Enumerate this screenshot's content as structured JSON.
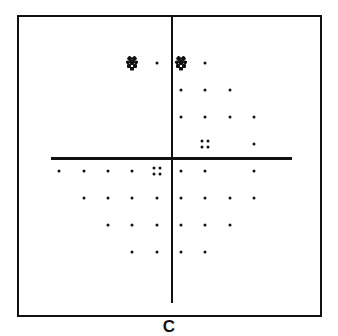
{
  "figure": {
    "caption": "C",
    "colors": {
      "ink": "#111111",
      "background": "#ffffff"
    },
    "grid": {
      "column_x": [
        59,
        84,
        108,
        132,
        157,
        181,
        205,
        230,
        254
      ],
      "row_y": [
        63,
        90,
        117,
        144,
        171,
        198,
        225,
        252
      ]
    },
    "legend_symbols": {
      "square": "solid-black-defect",
      "dense": "dense-stipple-defect",
      "quad": "four-dot-mild",
      "dot": "single-dot-normal"
    },
    "points": [
      {
        "row": 0,
        "col": 3,
        "symbol": "dense"
      },
      {
        "row": 0,
        "col": 4,
        "symbol": "dot"
      },
      {
        "row": 0,
        "col": 5,
        "symbol": "dense"
      },
      {
        "row": 0,
        "col": 6,
        "symbol": "dot"
      },
      {
        "row": 1,
        "col": 2,
        "symbol": "square"
      },
      {
        "row": 1,
        "col": 3,
        "symbol": "square"
      },
      {
        "row": 1,
        "col": 4,
        "symbol": "square"
      },
      {
        "row": 1,
        "col": 5,
        "symbol": "dot"
      },
      {
        "row": 1,
        "col": 6,
        "symbol": "dot"
      },
      {
        "row": 1,
        "col": 7,
        "symbol": "dot"
      },
      {
        "row": 2,
        "col": 1,
        "symbol": "square"
      },
      {
        "row": 2,
        "col": 2,
        "symbol": "square"
      },
      {
        "row": 2,
        "col": 3,
        "symbol": "square"
      },
      {
        "row": 2,
        "col": 4,
        "symbol": "square"
      },
      {
        "row": 2,
        "col": 5,
        "symbol": "dot"
      },
      {
        "row": 2,
        "col": 6,
        "symbol": "dot"
      },
      {
        "row": 2,
        "col": 7,
        "symbol": "dot"
      },
      {
        "row": 2,
        "col": 8,
        "symbol": "dot"
      },
      {
        "row": 3,
        "col": 0,
        "symbol": "square"
      },
      {
        "row": 3,
        "col": 1,
        "symbol": "square"
      },
      {
        "row": 3,
        "col": 2,
        "symbol": "square"
      },
      {
        "row": 3,
        "col": 3,
        "symbol": "square"
      },
      {
        "row": 3,
        "col": 4,
        "symbol": "square"
      },
      {
        "row": 3,
        "col": 5,
        "symbol": "square"
      },
      {
        "row": 3,
        "col": 6,
        "symbol": "quad"
      },
      {
        "row": 3,
        "col": 8,
        "symbol": "dot"
      },
      {
        "row": 4,
        "col": 0,
        "symbol": "dot"
      },
      {
        "row": 4,
        "col": 1,
        "symbol": "dot"
      },
      {
        "row": 4,
        "col": 2,
        "symbol": "dot"
      },
      {
        "row": 4,
        "col": 3,
        "symbol": "dot"
      },
      {
        "row": 4,
        "col": 4,
        "symbol": "quad"
      },
      {
        "row": 4,
        "col": 5,
        "symbol": "dot"
      },
      {
        "row": 4,
        "col": 6,
        "symbol": "dot"
      },
      {
        "row": 4,
        "col": 8,
        "symbol": "dot"
      },
      {
        "row": 5,
        "col": 1,
        "symbol": "dot"
      },
      {
        "row": 5,
        "col": 2,
        "symbol": "dot"
      },
      {
        "row": 5,
        "col": 3,
        "symbol": "dot"
      },
      {
        "row": 5,
        "col": 4,
        "symbol": "dot"
      },
      {
        "row": 5,
        "col": 5,
        "symbol": "dot"
      },
      {
        "row": 5,
        "col": 6,
        "symbol": "dot"
      },
      {
        "row": 5,
        "col": 7,
        "symbol": "dot"
      },
      {
        "row": 5,
        "col": 8,
        "symbol": "dot"
      },
      {
        "row": 6,
        "col": 2,
        "symbol": "dot"
      },
      {
        "row": 6,
        "col": 3,
        "symbol": "dot"
      },
      {
        "row": 6,
        "col": 4,
        "symbol": "dot"
      },
      {
        "row": 6,
        "col": 5,
        "symbol": "dot"
      },
      {
        "row": 6,
        "col": 6,
        "symbol": "dot"
      },
      {
        "row": 6,
        "col": 7,
        "symbol": "dot"
      },
      {
        "row": 7,
        "col": 3,
        "symbol": "dot"
      },
      {
        "row": 7,
        "col": 4,
        "symbol": "dot"
      },
      {
        "row": 7,
        "col": 5,
        "symbol": "dot"
      },
      {
        "row": 7,
        "col": 6,
        "symbol": "dot"
      }
    ]
  }
}
